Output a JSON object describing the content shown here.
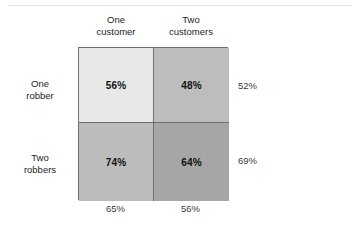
{
  "chart_data": {
    "type": "heatmap",
    "title": "",
    "xlabel": "",
    "ylabel": "",
    "row_categories": [
      "One robber",
      "Two robbers"
    ],
    "col_categories": [
      "One customer",
      "Two customers"
    ],
    "values": [
      [
        56,
        48
      ],
      [
        74,
        64
      ]
    ],
    "value_labels": [
      [
        "56%",
        "48%"
      ],
      [
        "74%",
        "64%"
      ]
    ],
    "row_margins": [
      52,
      69
    ],
    "row_margin_labels": [
      "52%",
      "69%"
    ],
    "col_margins": [
      65,
      56
    ],
    "col_margin_labels": [
      "65%",
      "56%"
    ],
    "unit": "%",
    "grid": true,
    "legend": "none",
    "cell_colors": [
      [
        "#e8e8e8",
        "#bdbdbd"
      ],
      [
        "#bcbcbc",
        "#a6a6a6"
      ]
    ],
    "border_color": "#6e6e6e"
  },
  "figure": {
    "columns": [
      {
        "line1": "One",
        "line2": "customer"
      },
      {
        "line1": "Two",
        "line2": "customers"
      }
    ],
    "rows": [
      {
        "line1": "One",
        "line2": "robber"
      },
      {
        "line1": "Two",
        "line2": "robbers"
      }
    ],
    "cells": [
      {
        "label": "56%"
      },
      {
        "label": "48%"
      },
      {
        "label": "74%"
      },
      {
        "label": "64%"
      }
    ],
    "row_margins": [
      {
        "label": "52%"
      },
      {
        "label": "69%"
      }
    ],
    "col_margins": [
      {
        "label": "65%"
      },
      {
        "label": "56%"
      }
    ]
  }
}
